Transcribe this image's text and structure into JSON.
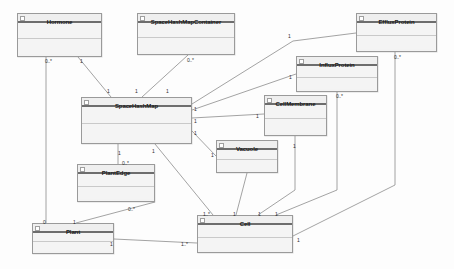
{
  "diagram": {
    "kind": "uml-class-diagram",
    "width": 454,
    "height": 269,
    "background_color": "#fdfdfd",
    "class_fill_color": "#f3f3f3",
    "class_border_color": "#9a9a9a",
    "header_rule_color": "#6d6d6d",
    "edge_color": "#8c8c8c"
  },
  "classes": [
    {
      "id": "hormone",
      "name": "Hormone",
      "x": 17,
      "y": 13,
      "w": 85,
      "h": 44
    },
    {
      "id": "spacehashmapcontainer",
      "name": "SpaceHashMapContainer",
      "x": 137,
      "y": 13,
      "w": 98,
      "h": 42
    },
    {
      "id": "effluxprotein",
      "name": "EffluxProtein",
      "x": 356,
      "y": 13,
      "w": 81,
      "h": 39
    },
    {
      "id": "influxprotein",
      "name": "InfluxProtein",
      "x": 296,
      "y": 56,
      "w": 82,
      "h": 36
    },
    {
      "id": "spacehashmap",
      "name": "SpaceHashMap",
      "x": 81,
      "y": 97,
      "w": 111,
      "h": 47
    },
    {
      "id": "cellmembrane",
      "name": "CellMembrane",
      "x": 264,
      "y": 95,
      "w": 63,
      "h": 41
    },
    {
      "id": "vacuole",
      "name": "Vacuole",
      "x": 216,
      "y": 140,
      "w": 62,
      "h": 33
    },
    {
      "id": "plantedge",
      "name": "PlantEdge",
      "x": 77,
      "y": 164,
      "w": 78,
      "h": 38
    },
    {
      "id": "plant",
      "name": "Plant",
      "x": 32,
      "y": 223,
      "w": 82,
      "h": 31
    },
    {
      "id": "cell",
      "name": "Cell",
      "x": 197,
      "y": 215,
      "w": 96,
      "h": 38
    }
  ],
  "icon": {
    "name": "class-icon"
  },
  "associations": [
    {
      "id": "hormone-plant",
      "from": "hormone",
      "to": "plant",
      "points": "46,57 46,223"
    },
    {
      "id": "hormone-shm",
      "from": "hormone",
      "to": "spacehashmap",
      "points": "78,57 111,97"
    },
    {
      "id": "shmc-shm",
      "from": "spacehashmapcontainer",
      "to": "spacehashmap",
      "points": "188,55 142,97"
    },
    {
      "id": "efflux-shm",
      "from": "effluxprotein",
      "to": "spacehashmap",
      "points": "356,33 293,41 192,104"
    },
    {
      "id": "influx-shm",
      "from": "influxprotein",
      "to": "spacehashmap",
      "points": "296,74 192,110"
    },
    {
      "id": "shm-cellmembrane",
      "from": "spacehashmap",
      "to": "cellmembrane",
      "points": "192,118 264,114"
    },
    {
      "id": "shm-vacuole",
      "from": "spacehashmap",
      "to": "vacuole",
      "points": "192,131 216,156"
    },
    {
      "id": "shm-cell",
      "from": "spacehashmap",
      "to": "cell",
      "points": "155,144 213,215"
    },
    {
      "id": "shm-plantedge",
      "from": "spacehashmap",
      "to": "plantedge",
      "points": "118,144 118,164"
    },
    {
      "id": "plantedge-plant",
      "from": "plantedge",
      "to": "plant",
      "points": "155,202 76,223"
    },
    {
      "id": "vacuole-cell",
      "from": "vacuole",
      "to": "cell",
      "points": "247,173 236,215"
    },
    {
      "id": "cellmembrane-cell",
      "from": "cellmembrane",
      "to": "cell",
      "points": "295,136 295,190 258,215"
    },
    {
      "id": "influx-cell",
      "from": "influxprotein",
      "to": "cell",
      "points": "337,92 337,190 276,215"
    },
    {
      "id": "efflux-cell",
      "from": "effluxprotein",
      "to": "cell",
      "points": "395,52 395,185 293,236"
    },
    {
      "id": "cell-plant",
      "from": "cell",
      "to": "plant",
      "points": "197,243 114,239"
    }
  ],
  "multiplicity_labels": [
    {
      "id": "m1",
      "text": "0..*",
      "x": 45,
      "y": 58
    },
    {
      "id": "m2",
      "text": "1",
      "x": 80,
      "y": 58
    },
    {
      "id": "m3",
      "text": "1",
      "x": 107,
      "y": 88
    },
    {
      "id": "m4",
      "text": "1",
      "x": 135,
      "y": 88
    },
    {
      "id": "m5",
      "text": "0..*",
      "x": 187,
      "y": 57
    },
    {
      "id": "m6",
      "text": "1",
      "x": 166,
      "y": 88
    },
    {
      "id": "m7",
      "text": "1",
      "x": 194,
      "y": 106
    },
    {
      "id": "m8",
      "text": "1",
      "x": 194,
      "y": 118
    },
    {
      "id": "m9",
      "text": "1",
      "x": 194,
      "y": 130
    },
    {
      "id": "m10",
      "text": "1",
      "x": 256,
      "y": 113
    },
    {
      "id": "m11",
      "text": "1",
      "x": 211,
      "y": 152
    },
    {
      "id": "m12",
      "text": "1",
      "x": 288,
      "y": 33
    },
    {
      "id": "m13",
      "text": "1",
      "x": 289,
      "y": 74
    },
    {
      "id": "m14",
      "text": "0..*",
      "x": 394,
      "y": 54
    },
    {
      "id": "m15",
      "text": "0..*",
      "x": 336,
      "y": 93
    },
    {
      "id": "m16",
      "text": "1",
      "x": 293,
      "y": 143
    },
    {
      "id": "m17",
      "text": "1",
      "x": 118,
      "y": 150
    },
    {
      "id": "m18",
      "text": "0..*",
      "x": 122,
      "y": 160
    },
    {
      "id": "m19",
      "text": "0..*",
      "x": 128,
      "y": 206
    },
    {
      "id": "m20",
      "text": "1",
      "x": 73,
      "y": 219
    },
    {
      "id": "m21",
      "text": "0",
      "x": 43,
      "y": 219
    },
    {
      "id": "m22",
      "text": "1",
      "x": 152,
      "y": 148
    },
    {
      "id": "m23",
      "text": "1..*",
      "x": 203,
      "y": 211
    },
    {
      "id": "m24",
      "text": "1",
      "x": 233,
      "y": 211
    },
    {
      "id": "m25",
      "text": "1",
      "x": 258,
      "y": 211
    },
    {
      "id": "m26",
      "text": "1",
      "x": 275,
      "y": 211
    },
    {
      "id": "m27",
      "text": "1",
      "x": 297,
      "y": 237
    },
    {
      "id": "m28",
      "text": "1",
      "x": 110,
      "y": 241
    },
    {
      "id": "m29",
      "text": "1..*",
      "x": 181,
      "y": 241
    }
  ]
}
